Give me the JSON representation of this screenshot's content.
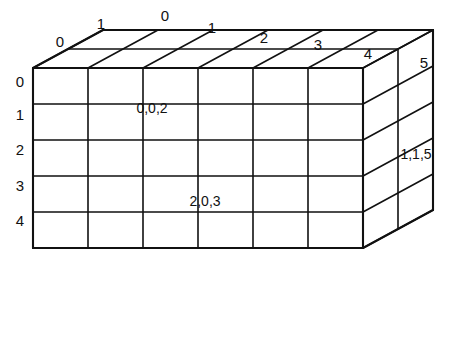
{
  "figure": {
    "line_color": "#111111",
    "face_color": "#ffffff",
    "background_color": "#ffffff"
  },
  "geometry": {
    "columns": 6,
    "rows": 5,
    "depth": 2,
    "origin_x": 33,
    "origin_y": 68,
    "cell_width": 55,
    "cell_height": 36,
    "depth_dx": 35,
    "depth_dy": -19
  },
  "axes": {
    "depth_axis": {
      "name": "depth-axis",
      "ticks": [
        {
          "label": "0",
          "x": 60,
          "y": 47
        },
        {
          "label": "1",
          "x": 101,
          "y": 29
        }
      ]
    },
    "column_axis": {
      "name": "column-axis",
      "ticks": [
        {
          "label": "0",
          "x": 165,
          "y": 21
        },
        {
          "label": "1",
          "x": 212,
          "y": 33
        },
        {
          "label": "2",
          "x": 264,
          "y": 43
        },
        {
          "label": "3",
          "x": 318,
          "y": 50
        },
        {
          "label": "4",
          "x": 368,
          "y": 59
        },
        {
          "label": "5",
          "x": 424,
          "y": 68
        }
      ]
    },
    "row_axis": {
      "name": "row-axis",
      "ticks": [
        {
          "label": "0",
          "x": 20,
          "y": 87
        },
        {
          "label": "1",
          "x": 20,
          "y": 120
        },
        {
          "label": "2",
          "x": 20,
          "y": 155
        },
        {
          "label": "3",
          "x": 20,
          "y": 191
        },
        {
          "label": "4",
          "x": 20,
          "y": 226
        }
      ]
    }
  },
  "cell_labels": [
    {
      "name": "cell-label-0-0-2",
      "text": "0,0,2",
      "x": 152,
      "y": 113
    },
    {
      "name": "cell-label-2-0-3",
      "text": "2,0,3",
      "x": 205,
      "y": 206
    },
    {
      "name": "cell-label-1-1-5",
      "text": "1,1,5",
      "x": 416,
      "y": 159
    }
  ]
}
